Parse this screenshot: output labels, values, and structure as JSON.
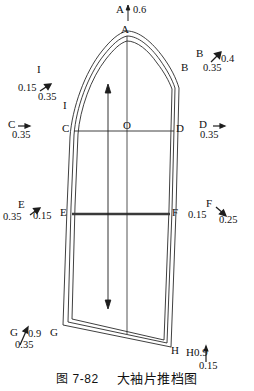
{
  "figure": {
    "caption_prefix": "图 7-82",
    "caption_title": "大袖片推档图",
    "kind": "garment-pattern-grading-diagram"
  },
  "vertices": {
    "A": "A",
    "B": "B",
    "C": "C",
    "D": "D",
    "E": "E",
    "F": "F",
    "G": "G",
    "H": "H",
    "I": "I",
    "O": "O"
  },
  "annotations": [
    {
      "id": "A",
      "point": "A",
      "icon": "vertical-arrow-icon",
      "values": [
        "0.6"
      ],
      "vertical": "0.6",
      "horizontal": ""
    },
    {
      "id": "B",
      "point": "B",
      "icon": "diagonal-arrow-icon",
      "values": [
        "0.4",
        "0.35"
      ],
      "vertical": "0.4",
      "horizontal": "0.35"
    },
    {
      "id": "I",
      "point": "I",
      "icon": "diagonal-arrow-icon",
      "values": [
        "0.15",
        "0.35"
      ],
      "vertical": "0.15",
      "horizontal": "0.35"
    },
    {
      "id": "C",
      "point": "C",
      "icon": "horizontal-arrow-icon",
      "values": [
        "0.35"
      ],
      "vertical": "",
      "horizontal": "0.35"
    },
    {
      "id": "D",
      "point": "D",
      "icon": "horizontal-arrow-icon",
      "values": [
        "0.35"
      ],
      "vertical": "",
      "horizontal": "0.35"
    },
    {
      "id": "E",
      "point": "E",
      "icon": "diagonal-arrow-icon",
      "values": [
        "0.35",
        "0.15"
      ],
      "vertical": "0.15",
      "horizontal": "0.35"
    },
    {
      "id": "F",
      "point": "F",
      "icon": "diagonal-arrow-icon",
      "values": [
        "0.15",
        "0.25"
      ],
      "vertical": "0.15",
      "horizontal": "0.25"
    },
    {
      "id": "G",
      "point": "G",
      "icon": "diagonal-arrow-icon",
      "values": [
        "0.9",
        "0.35"
      ],
      "vertical": "0.9",
      "horizontal": "0.35"
    },
    {
      "id": "H",
      "point": "H",
      "icon": "vertical-arrow-icon",
      "values": [
        "0.9",
        "0.15"
      ],
      "vertical": "0.9",
      "horizontal": "0.15"
    }
  ],
  "labels": {
    "a_point": "A",
    "a_value": "0.6",
    "b_point_top": "B",
    "b_point_on_curve": "B",
    "b_value_v": "0.4",
    "b_value_h": "0.35",
    "i_point_top": "I",
    "i_point_on_curve": "I",
    "i_value_left": "0.15",
    "i_value_below": "0.35",
    "c_point_label": "C",
    "c_point_on_curve": "C",
    "c_value": "0.35",
    "d_point_on_curve": "D",
    "d_point_label": "D",
    "d_value": "0.35",
    "o_point": "O",
    "e_point_top": "E",
    "e_value_left": "0.35",
    "e_value_right": "0.15",
    "e_point_on_curve": "E",
    "f_point_on_curve": "F",
    "f_point_top": "F",
    "f_value_left": "0.15",
    "f_value_right": "0.25",
    "g_point_label": "G",
    "g_value_v": "0.9",
    "g_value_h": "0.35",
    "g_point_on_curve": "G",
    "h_point_on_curve": "H",
    "h_label_value": "H0.9",
    "h_value_below": "0.15"
  },
  "colors": {
    "ink": "#1a1a1a",
    "paper": "#ffffff",
    "rule": "#333333",
    "heavy": "#3a3a3a"
  }
}
